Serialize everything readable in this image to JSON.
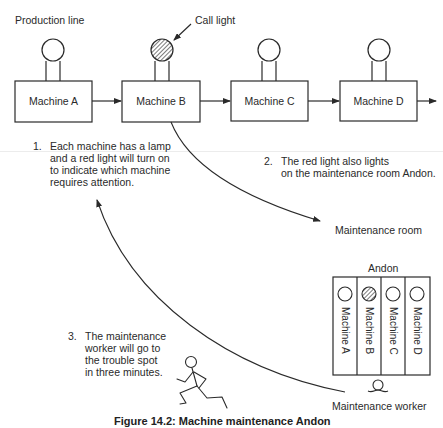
{
  "diagram": {
    "title_label": "Production line",
    "call_light_label": "Call light",
    "machines": [
      {
        "label": "Machine A",
        "lamp_on": false
      },
      {
        "label": "Machine B",
        "lamp_on": true
      },
      {
        "label": "Machine C",
        "lamp_on": false
      },
      {
        "label": "Machine D",
        "lamp_on": false
      }
    ],
    "notes": [
      {
        "number": "1.",
        "lines": [
          "Each machine has a lamp",
          "and a red light will turn on",
          "to indicate which machine",
          "requires attention."
        ]
      },
      {
        "number": "2.",
        "lines": [
          "The red light also lights",
          "on the maintenance room Andon."
        ]
      },
      {
        "number": "3.",
        "lines": [
          "The maintenance",
          "worker will go to",
          "the trouble spot",
          "in three minutes."
        ]
      }
    ],
    "maintenance_room_label": "Maintenance room",
    "andon": {
      "label": "Andon",
      "columns": [
        {
          "label": "Machine A",
          "lamp_on": false
        },
        {
          "label": "Machine B",
          "lamp_on": true
        },
        {
          "label": "Machine C",
          "lamp_on": false
        },
        {
          "label": "Machine D",
          "lamp_on": false
        }
      ]
    },
    "worker_label": "Maintenance worker",
    "caption": "Figure 14.2: Machine maintenance Andon"
  },
  "colors": {
    "line": "#2a2a2a",
    "text": "#2a2a2a",
    "background": "#ffffff"
  }
}
